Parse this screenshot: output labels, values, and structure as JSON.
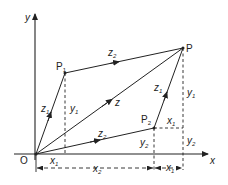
{
  "diagram": {
    "title": "",
    "axes": {
      "x_label": "x",
      "y_label": "y",
      "origin_label": "O"
    },
    "points": {
      "P1": {
        "label": "P",
        "sub": "1"
      },
      "P2": {
        "label": "P",
        "sub": "2"
      },
      "P": {
        "label": "P"
      }
    },
    "vectors": {
      "OP1": {
        "label": "z",
        "sub": "1"
      },
      "P1P": {
        "label": "z",
        "sub": "2"
      },
      "OP": {
        "label": "z"
      },
      "OP2": {
        "label": "z",
        "sub": "2"
      },
      "P2P": {
        "label": "z",
        "sub": "1"
      }
    },
    "dimensions": {
      "x1_left": {
        "label": "x",
        "sub": "1"
      },
      "x2_bottom": {
        "label": "x",
        "sub": "2"
      },
      "x1_bottom_right": {
        "label": "x",
        "sub": "1"
      },
      "x1_upper_right": {
        "label": "x",
        "sub": "1"
      },
      "y1_left": {
        "label": "y",
        "sub": "1"
      },
      "y1_right": {
        "label": "y",
        "sub": "1"
      },
      "y2_mid": {
        "label": "y",
        "sub": "2"
      },
      "y2_right": {
        "label": "y",
        "sub": "2"
      }
    },
    "colors": {
      "line": "#222222",
      "background": "#ffffff"
    }
  }
}
